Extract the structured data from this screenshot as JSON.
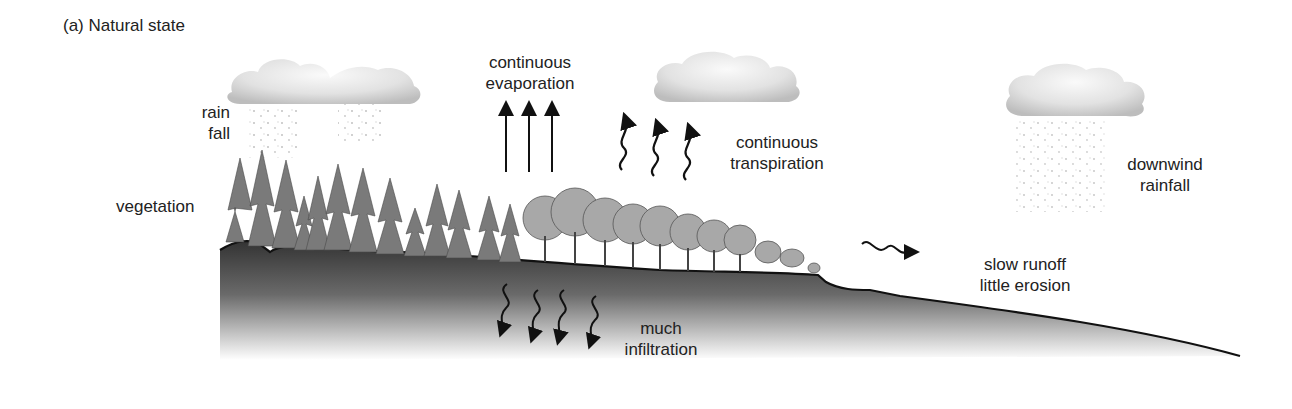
{
  "figure": {
    "title": "(a) Natural state",
    "labels": {
      "rain_fall": [
        "rain",
        "fall"
      ],
      "vegetation": "vegetation",
      "evaporation": [
        "continuous",
        "evaporation"
      ],
      "transpiration": [
        "continuous",
        "transpiration"
      ],
      "downwind_rainfall": [
        "downwind",
        "rainfall"
      ],
      "runoff": [
        "slow runoff",
        "little erosion"
      ],
      "infiltration": [
        "much",
        "infiltration"
      ]
    },
    "colors": {
      "ground_top": "#3a3a3a",
      "ground_bottom": "#ffffff",
      "cloud": "#d9d9d9",
      "ink": "#111111",
      "trees": "#6e6e6e"
    }
  }
}
